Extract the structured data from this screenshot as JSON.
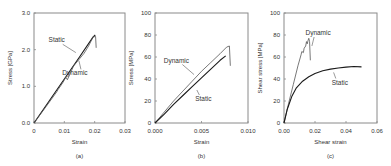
{
  "figure": {
    "panels": [
      "(a)",
      "(b)",
      "(c)"
    ]
  },
  "chart_data": [
    {
      "type": "line",
      "panel_label": "(a)",
      "title": "",
      "xlabel": "Strain",
      "ylabel": "Stress [GPa]",
      "xlim": [
        0,
        0.03
      ],
      "ylim": [
        0,
        3.0
      ],
      "xticks": [
        0,
        0.01,
        0.02,
        0.03
      ],
      "xtick_labels": [
        "0",
        "0.01",
        "0.02",
        "0.03"
      ],
      "yticks": [
        0,
        1.0,
        2.0,
        3.0
      ],
      "ytick_labels": [
        "0.0",
        "1.0",
        "2.0",
        "3.0"
      ],
      "grid": false,
      "legend": "inline-annotations",
      "box": {
        "x0": 34,
        "y0": 13,
        "x1": 125,
        "y1": 123
      },
      "series": [
        {
          "name": "Static",
          "x": [
            0,
            0.005,
            0.01,
            0.015,
            0.0195,
            0.0202
          ],
          "y": [
            0,
            0.6,
            1.2,
            1.8,
            2.35,
            2.4
          ],
          "annotation": {
            "text": "Static",
            "tx": 0.0075,
            "ty": 2.2,
            "lx": 0.0138,
            "ly": 1.92
          }
        },
        {
          "name": "Dynamic",
          "x": [
            0,
            0.004,
            0.0075,
            0.008,
            0.0095,
            0.0105,
            0.011,
            0.0125,
            0.013,
            0.015,
            0.0165,
            0.018,
            0.0195,
            0.0203,
            0.0205
          ],
          "y": [
            0,
            0.45,
            0.85,
            0.92,
            1.1,
            1.25,
            1.18,
            1.45,
            1.55,
            1.75,
            1.9,
            2.1,
            2.35,
            2.36,
            2.05
          ],
          "annotation": {
            "text": "Dynamic",
            "tx": 0.0135,
            "ty": 1.3,
            "lx": 0.0148,
            "ly": 1.7
          }
        }
      ]
    },
    {
      "type": "line",
      "panel_label": "(b)",
      "title": "",
      "xlabel": "Strain",
      "ylabel": "Stress [MPa]",
      "xlim": [
        0,
        0.01
      ],
      "ylim": [
        0,
        100
      ],
      "xticks": [
        0,
        0.005,
        0.01
      ],
      "xtick_labels": [
        "0.000",
        "0.005",
        "0.010"
      ],
      "yticks": [
        0,
        20,
        40,
        60,
        80,
        100
      ],
      "ytick_labels": [
        "0",
        "20",
        "40",
        "60",
        "80",
        "100"
      ],
      "grid": false,
      "legend": "inline-annotations",
      "box": {
        "x0": 155,
        "y0": 13,
        "x1": 248,
        "y1": 123
      },
      "series": [
        {
          "name": "Dynamic",
          "x": [
            0,
            0.001,
            0.002,
            0.003,
            0.004,
            0.005,
            0.006,
            0.007,
            0.0077,
            0.008,
            0.0081
          ],
          "y": [
            0,
            10,
            20,
            29,
            38,
            47,
            55,
            63,
            69,
            70,
            52
          ],
          "annotation": {
            "text": "Dynamic",
            "tx": 0.0023,
            "ty": 55,
            "lx": 0.0042,
            "ly": 44
          }
        },
        {
          "name": "Static",
          "x": [
            0,
            0.001,
            0.002,
            0.003,
            0.004,
            0.005,
            0.006,
            0.007,
            0.0076
          ],
          "y": [
            0,
            8,
            17,
            25,
            33,
            41,
            49,
            57,
            61
          ],
          "annotation": {
            "text": "Static",
            "tx": 0.0052,
            "ty": 20,
            "lx": 0.0045,
            "ly": 30
          }
        }
      ]
    },
    {
      "type": "line",
      "panel_label": "(c)",
      "title": "",
      "xlabel": "Shear strain",
      "ylabel": "Shear stress [MPa]",
      "xlim": [
        0,
        0.06
      ],
      "ylim": [
        0,
        100
      ],
      "xticks": [
        0,
        0.02,
        0.04,
        0.06
      ],
      "xtick_labels": [
        "0.00",
        "0.02",
        "0.04",
        "0.06"
      ],
      "yticks": [
        0,
        20,
        40,
        60,
        80,
        100
      ],
      "ytick_labels": [
        "0",
        "20",
        "40",
        "60",
        "80",
        "100"
      ],
      "grid": false,
      "legend": "inline-annotations",
      "box": {
        "x0": 284,
        "y0": 13,
        "x1": 377,
        "y1": 123
      },
      "series": [
        {
          "name": "Dynamic",
          "x": [
            0,
            0.003,
            0.006,
            0.009,
            0.011,
            0.0115,
            0.0125,
            0.013,
            0.014,
            0.0145,
            0.015,
            0.0155,
            0.016,
            0.0165,
            0.017
          ],
          "y": [
            0,
            18,
            35,
            52,
            62,
            65,
            64,
            68,
            70,
            74,
            72,
            75,
            77,
            74,
            57
          ],
          "annotation": {
            "text": "Dynamic",
            "tx": 0.022,
            "ty": 80,
            "lx": 0.018,
            "ly": 70
          }
        },
        {
          "name": "Static",
          "x": [
            0,
            0.002,
            0.005,
            0.008,
            0.012,
            0.016,
            0.02,
            0.025,
            0.03,
            0.035,
            0.04,
            0.045,
            0.05
          ],
          "y": [
            0,
            12,
            24,
            32,
            38,
            42,
            45,
            47.5,
            49,
            50,
            50.8,
            51.3,
            51
          ],
          "annotation": {
            "text": "Static",
            "tx": 0.036,
            "ty": 35,
            "lx": 0.032,
            "ly": 46
          }
        }
      ]
    }
  ]
}
